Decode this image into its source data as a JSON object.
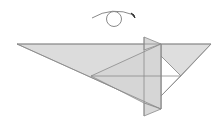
{
  "diagram": {
    "type": "origami-step",
    "instruction_symbol": "turn-over",
    "colors": {
      "paper": "#dcdcdc",
      "paper_light": "#e4e4e4",
      "line": "#8a8a8a",
      "background": "#ffffff",
      "white_area": "#ffffff"
    }
  }
}
